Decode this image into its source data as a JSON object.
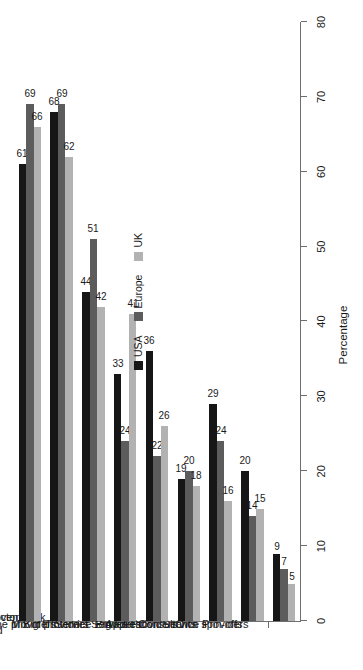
{
  "chart_data": {
    "type": "bar",
    "title": "",
    "subtitle": "",
    "orientation": "vertical-bars-rotated-90",
    "xlabel": "",
    "ylabel": "Percentage",
    "ylim": [
      0,
      80
    ],
    "ytick_labels": [
      "0",
      "10",
      "20",
      "30",
      "40",
      "50",
      "60",
      "70",
      "80"
    ],
    "ytick_values": [
      0,
      10,
      20,
      30,
      40,
      50,
      60,
      70,
      80
    ],
    "grid": false,
    "legend_position": "top-center",
    "categories": [
      "Those with industry sector\nexperience",
      "Those with proven track record",
      "Niche providers",
      "Mix of providers",
      "Big IT Service Providers",
      "Internet Service Providers",
      "Big Five Consultants",
      "Application Service Providers",
      "Own spin-offs"
    ],
    "series": [
      {
        "name": "USA",
        "color": "#161616",
        "values": [
          61,
          68,
          44,
          33,
          36,
          19,
          29,
          20,
          9
        ]
      },
      {
        "name": "Europe",
        "color": "#5c5c5c",
        "values": [
          69,
          69,
          51,
          24,
          22,
          20,
          24,
          14,
          7
        ]
      },
      {
        "name": "UK",
        "color": "#b2b2b2",
        "values": [
          66,
          62,
          42,
          41,
          26,
          18,
          16,
          15,
          5
        ]
      }
    ]
  },
  "legend": {
    "items": [
      {
        "label": "USA",
        "swatch": "usa"
      },
      {
        "label": "Europe",
        "swatch": "europe"
      },
      {
        "label": "UK",
        "swatch": "uk"
      }
    ]
  },
  "axis": {
    "value_axis_title": "Percentage"
  }
}
